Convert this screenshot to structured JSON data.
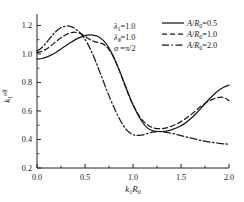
{
  "chart_data": {
    "type": "line",
    "title": "",
    "xlabel": "k1R0",
    "ylabel": "k1eff",
    "xlim": [
      0.0,
      2.0
    ],
    "ylim": [
      0.2,
      1.28
    ],
    "grid": false,
    "xticks": [
      "0.0",
      "0.5",
      "1.0",
      "1.5",
      "2.0"
    ],
    "xtick_values": [
      0.0,
      0.5,
      1.0,
      1.5,
      2.0
    ],
    "yticks": [
      "0.2",
      "0.4",
      "0.6",
      "0.8",
      "1.0",
      "1.2"
    ],
    "ytick_values": [
      0.2,
      0.4,
      0.6,
      0.8,
      1.0,
      1.2
    ],
    "legend_position": "top-right",
    "series": [
      {
        "name": "A/R0=0.5",
        "style": "solid",
        "color": "#1a1a1a",
        "x": [
          0.0,
          0.05,
          0.1,
          0.15,
          0.2,
          0.25,
          0.3,
          0.35,
          0.4,
          0.45,
          0.5,
          0.55,
          0.58,
          0.62,
          0.66,
          0.7,
          0.74,
          0.78,
          0.82,
          0.86,
          0.9,
          0.94,
          0.98,
          1.02,
          1.06,
          1.1,
          1.14,
          1.18,
          1.22,
          1.26,
          1.3,
          1.36,
          1.42,
          1.48,
          1.54,
          1.6,
          1.66,
          1.72,
          1.78,
          1.84,
          1.9,
          1.95,
          2.0
        ],
        "y": [
          0.963,
          0.968,
          0.978,
          0.993,
          1.012,
          1.035,
          1.058,
          1.08,
          1.1,
          1.116,
          1.128,
          1.133,
          1.132,
          1.126,
          1.112,
          1.088,
          1.052,
          1.004,
          0.946,
          0.881,
          0.812,
          0.742,
          0.676,
          0.616,
          0.563,
          0.519,
          0.487,
          0.468,
          0.459,
          0.456,
          0.456,
          0.461,
          0.472,
          0.489,
          0.513,
          0.545,
          0.584,
          0.628,
          0.673,
          0.714,
          0.748,
          0.768,
          0.782
        ]
      },
      {
        "name": "A/R0=1.0",
        "style": "dashed",
        "color": "#1a1a1a",
        "x": [
          0.0,
          0.05,
          0.1,
          0.15,
          0.2,
          0.25,
          0.3,
          0.35,
          0.4,
          0.44,
          0.48,
          0.52,
          0.56,
          0.6,
          0.64,
          0.68,
          0.72,
          0.76,
          0.8,
          0.84,
          0.88,
          0.92,
          0.96,
          1.0,
          1.04,
          1.08,
          1.12,
          1.16,
          1.2,
          1.26,
          1.32,
          1.38,
          1.44,
          1.5,
          1.56,
          1.62,
          1.68,
          1.74,
          1.8,
          1.86,
          1.92,
          1.96,
          2.0
        ],
        "y": [
          1.01,
          1.018,
          1.035,
          1.06,
          1.088,
          1.113,
          1.134,
          1.148,
          1.152,
          1.147,
          1.133,
          1.114,
          1.097,
          1.086,
          1.08,
          1.072,
          1.054,
          1.022,
          0.974,
          0.913,
          0.843,
          0.771,
          0.703,
          0.643,
          0.592,
          0.551,
          0.52,
          0.498,
          0.485,
          0.476,
          0.478,
          0.488,
          0.504,
          0.525,
          0.552,
          0.583,
          0.617,
          0.648,
          0.672,
          0.69,
          0.697,
          0.69,
          0.672
        ]
      },
      {
        "name": "A/R0=2.0",
        "style": "dashdot",
        "color": "#1a1a1a",
        "x": [
          0.0,
          0.04,
          0.08,
          0.12,
          0.16,
          0.2,
          0.24,
          0.28,
          0.32,
          0.36,
          0.4,
          0.44,
          0.48,
          0.52,
          0.56,
          0.6,
          0.64,
          0.68,
          0.72,
          0.76,
          0.8,
          0.84,
          0.88,
          0.92,
          0.96,
          1.0,
          1.04,
          1.1,
          1.16,
          1.22,
          1.28,
          1.34,
          1.42,
          1.5,
          1.58,
          1.66,
          1.74,
          1.82,
          1.9,
          1.96,
          2.0
        ],
        "y": [
          1.02,
          1.038,
          1.065,
          1.098,
          1.131,
          1.159,
          1.18,
          1.192,
          1.196,
          1.19,
          1.176,
          1.154,
          1.122,
          1.08,
          1.028,
          0.966,
          0.898,
          0.828,
          0.757,
          0.69,
          0.627,
          0.57,
          0.519,
          0.478,
          0.45,
          0.434,
          0.428,
          0.432,
          0.444,
          0.454,
          0.456,
          0.452,
          0.441,
          0.427,
          0.413,
          0.4,
          0.389,
          0.38,
          0.373,
          0.369,
          0.367
        ]
      }
    ],
    "annotations": [
      {
        "text": "lambda1 = 1.0",
        "render": "λ₁=1.0"
      },
      {
        "text": "lambdaII = 1.0",
        "render": "λⅡ=1.0"
      },
      {
        "text": "alpha = pi/2",
        "render": "α =π/2"
      }
    ]
  },
  "axes": {
    "x_label_main": "k",
    "x_label_sub": "1",
    "x_label_tail": "R",
    "x_label_tail_sub": "0",
    "y_label_main": "k",
    "y_label_sub": "1",
    "y_label_sup": "eff"
  },
  "params": {
    "lambda1": "λ",
    "lambda1_sub": "1",
    "lambda1_val": "=1.0",
    "lambda2": "λ",
    "lambda2_sub": "Ⅱ",
    "lambda2_val": "=1.0",
    "alpha": "α",
    "alpha_val": " =π/2"
  },
  "legend": {
    "items": [
      {
        "label_pre": "A",
        "label_slash": "/",
        "label_R": "R",
        "label_sub": "0",
        "label_val": "=0.5",
        "style": "solid"
      },
      {
        "label_pre": "A",
        "label_slash": "/",
        "label_R": "R",
        "label_sub": "0",
        "label_val": "=1.0",
        "style": "dashed"
      },
      {
        "label_pre": "A",
        "label_slash": "/",
        "label_R": "R",
        "label_sub": "0",
        "label_val": "=2.0",
        "style": "dashdot"
      }
    ]
  }
}
